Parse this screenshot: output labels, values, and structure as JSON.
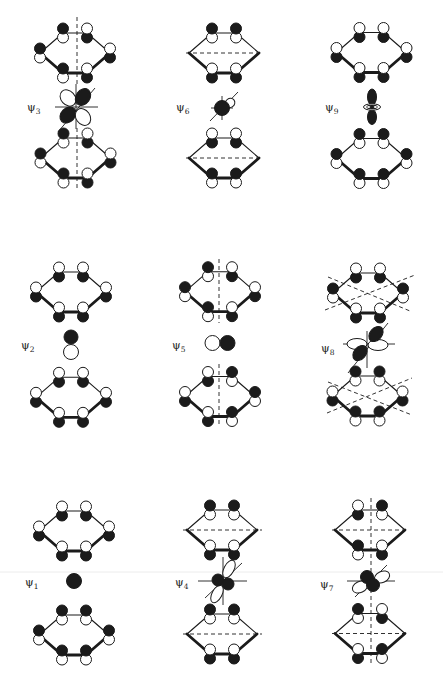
{
  "canvas": {
    "width": 443,
    "height": 679
  },
  "style": {
    "ink": "#1b1b1b",
    "paper": "#ffffff",
    "scan_line_color": "#ececec",
    "lobe_r": 5.5,
    "lobe_offset": 4.5
  },
  "scan_line": {
    "y": 572
  },
  "ring_template": {
    "order": [
      "TL",
      "TR",
      "R",
      "BR",
      "BL",
      "L"
    ],
    "offsets": {
      "TL": [
        -12,
        -20
      ],
      "TR": [
        12,
        -20
      ],
      "R": [
        35,
        0
      ],
      "BR": [
        12,
        20
      ],
      "BL": [
        -12,
        20
      ],
      "L": [
        -35,
        0
      ]
    },
    "front_bonds": [
      "R-BR",
      "BR-BL",
      "BL-L"
    ]
  },
  "panels": [
    {
      "id": "psi3",
      "label": {
        "symbol": "ψ",
        "subscript": "3",
        "x": 27,
        "y": 111
      },
      "rings": [
        {
          "position": "top",
          "cx": 75,
          "cy": 53,
          "upper_lobes": [
            "black",
            "white",
            "white",
            "white",
            "black",
            "black"
          ]
        },
        {
          "position": "bottom",
          "cx": 75.5,
          "cy": 158,
          "upper_lobes": [
            "black",
            "white",
            "white",
            "white",
            "black",
            "black"
          ]
        }
      ],
      "nodal_planes": [
        [
          77,
          17,
          77,
          86
        ],
        [
          77,
          128,
          77,
          190
        ]
      ],
      "orbital": {
        "cx": 76,
        "cy": 107,
        "axes": [
          [
            -21,
            0,
            22,
            0
          ],
          [
            0,
            -23,
            0,
            22
          ],
          [
            -18,
            25,
            19,
            -19
          ]
        ],
        "lobes": [
          {
            "x": -8,
            "y": -9,
            "rx": 9,
            "ry": 7,
            "rot": 48,
            "fill": "white"
          },
          {
            "x": 7,
            "y": -10,
            "rx": 9,
            "ry": 7,
            "rot": -55,
            "fill": "black"
          },
          {
            "x": -8,
            "y": 8,
            "rx": 9,
            "ry": 7,
            "rot": -45,
            "fill": "black"
          },
          {
            "x": 7,
            "y": 10,
            "rx": 9,
            "ry": 7,
            "rot": 55,
            "fill": "white"
          }
        ]
      }
    },
    {
      "id": "psi6",
      "label": {
        "symbol": "ψ",
        "subscript": "6",
        "x": 176,
        "y": 111
      },
      "rings": [
        {
          "position": "top",
          "cx": 224,
          "cy": 53,
          "upper_lobes": [
            "black",
            "black",
            null,
            "white",
            "white",
            null
          ]
        },
        {
          "position": "bottom",
          "cx": 224,
          "cy": 158,
          "upper_lobes": [
            "white",
            "white",
            null,
            "black",
            "black",
            null
          ]
        }
      ],
      "nodal_planes": [
        [
          186,
          53,
          262,
          53
        ],
        [
          186,
          158,
          262,
          158
        ]
      ],
      "orbital": {
        "cx": 222,
        "cy": 108,
        "axes": [
          [
            -12,
            13,
            16,
            -16
          ],
          [
            -11,
            0,
            11,
            0
          ],
          [
            0,
            -12,
            0,
            12
          ]
        ],
        "lobes": [
          {
            "x": 8,
            "y": -5,
            "rx": 5,
            "ry": 4.5,
            "rot": -35,
            "fill": "white"
          },
          {
            "x": 0,
            "y": 0,
            "rx": 7.5,
            "ry": 7.5,
            "rot": 0,
            "fill": "black"
          }
        ]
      }
    },
    {
      "id": "psi9",
      "label": {
        "symbol": "ψ",
        "subscript": "9",
        "x": 325,
        "y": 111
      },
      "rings": [
        {
          "position": "top",
          "cx": 371.5,
          "cy": 52.5,
          "upper_lobes": [
            "white",
            "white",
            "white",
            "white",
            "white",
            "white"
          ]
        },
        {
          "position": "bottom",
          "cx": 371.5,
          "cy": 158.5,
          "upper_lobes": [
            "black",
            "black",
            "black",
            "black",
            "black",
            "black"
          ]
        }
      ],
      "nodal_planes": [],
      "orbital": {
        "cx": 372,
        "cy": 107,
        "axes": [],
        "lobes": [
          {
            "x": 0,
            "y": 10,
            "rx": 4.5,
            "ry": 7.5,
            "rot": 0,
            "fill": "black"
          },
          {
            "x": 0,
            "y": -10,
            "rx": 4.5,
            "ry": 8,
            "rot": 0,
            "fill": "black"
          },
          {
            "x": 0,
            "y": 0,
            "rx": 8.5,
            "ry": 3.2,
            "rot": 0,
            "fill": "white"
          },
          {
            "x": 0,
            "y": 0,
            "rx": 5.5,
            "ry": 1.8,
            "rot": 0,
            "fill": "none"
          },
          {
            "x": 0,
            "y": 0,
            "rx": 2,
            "ry": 1.6,
            "rot": 0,
            "fill": "black"
          }
        ]
      }
    },
    {
      "id": "psi2",
      "label": {
        "symbol": "ψ",
        "subscript": "2",
        "x": 21,
        "y": 349
      },
      "rings": [
        {
          "position": "top",
          "cx": 71,
          "cy": 292,
          "upper_lobes": [
            "white",
            "white",
            "white",
            "white",
            "white",
            "white"
          ]
        },
        {
          "position": "bottom",
          "cx": 71,
          "cy": 397.3,
          "upper_lobes": [
            "white",
            "white",
            "white",
            "white",
            "white",
            "white"
          ]
        }
      ],
      "nodal_planes": [],
      "orbital": {
        "cx": 71,
        "cy": 344,
        "axes": [],
        "lobes": [
          {
            "x": 0,
            "y": -7,
            "rx": 7,
            "ry": 7,
            "rot": 0,
            "fill": "black"
          },
          {
            "x": 0,
            "y": 8,
            "rx": 7.5,
            "ry": 7.5,
            "rot": 0,
            "fill": "white"
          }
        ]
      }
    },
    {
      "id": "psi5",
      "label": {
        "symbol": "ψ",
        "subscript": "5",
        "x": 172,
        "y": 349
      },
      "rings": [
        {
          "position": "top",
          "cx": 220,
          "cy": 291.7,
          "upper_lobes": [
            "black",
            "white",
            "white",
            "white",
            "black",
            "black"
          ]
        },
        {
          "position": "bottom",
          "cx": 220,
          "cy": 396.5,
          "upper_lobes": [
            "white",
            "black",
            "black",
            "black",
            "white",
            "white"
          ]
        }
      ],
      "nodal_planes": [
        [
          219,
          259,
          219,
          323
        ],
        [
          219,
          364,
          219,
          426
        ]
      ],
      "orbital": {
        "cx": 220,
        "cy": 343,
        "axes": [],
        "lobes": [
          {
            "x": -7.5,
            "y": 0,
            "rx": 7.5,
            "ry": 7.5,
            "rot": 0,
            "fill": "white"
          },
          {
            "x": 7.5,
            "y": 0,
            "rx": 7.5,
            "ry": 7.5,
            "rot": 0,
            "fill": "black"
          }
        ]
      }
    },
    {
      "id": "psi8",
      "label": {
        "symbol": "ψ",
        "subscript": "8",
        "x": 321,
        "y": 352
      },
      "rings": [
        {
          "position": "top",
          "cx": 368,
          "cy": 293,
          "upper_lobes": [
            "white",
            "white",
            "black",
            "white",
            "white",
            "black"
          ]
        },
        {
          "position": "bottom",
          "cx": 367.5,
          "cy": 396,
          "upper_lobes": [
            "black",
            "black",
            "white",
            "black",
            "black",
            "white"
          ]
        }
      ],
      "nodal_planes": [
        [
          325,
          310,
          415,
          275
        ],
        [
          328,
          277,
          410,
          311
        ],
        [
          327,
          413,
          412,
          378
        ],
        [
          328,
          382,
          412,
          415
        ]
      ],
      "orbital": {
        "cx": 367,
        "cy": 344,
        "axes": [
          [
            -24,
            0,
            28,
            0
          ],
          [
            0,
            -13,
            0,
            24
          ],
          [
            -19,
            29,
            21,
            -21
          ]
        ],
        "lobes": [
          {
            "x": -10,
            "y": 0,
            "rx": 10,
            "ry": 5.5,
            "rot": 0,
            "fill": "white"
          },
          {
            "x": 11,
            "y": 1,
            "rx": 10,
            "ry": 5.5,
            "rot": 0,
            "fill": "white"
          },
          {
            "x": 9,
            "y": -10,
            "rx": 8.5,
            "ry": 6,
            "rot": -50,
            "fill": "black"
          },
          {
            "x": -7,
            "y": 9,
            "rx": 8.5,
            "ry": 6,
            "rot": -50,
            "fill": "black"
          }
        ]
      }
    },
    {
      "id": "psi1",
      "label": {
        "symbol": "ψ",
        "subscript": "1",
        "x": 25,
        "y": 586
      },
      "rings": [
        {
          "position": "top",
          "cx": 74,
          "cy": 531,
          "upper_lobes": [
            "white",
            "white",
            "white",
            "white",
            "white",
            "white"
          ]
        },
        {
          "position": "bottom",
          "cx": 74,
          "cy": 635,
          "upper_lobes": [
            "black",
            "black",
            "black",
            "black",
            "black",
            "black"
          ]
        }
      ],
      "nodal_planes": [],
      "orbital": {
        "cx": 74,
        "cy": 581,
        "axes": [],
        "lobes": [
          {
            "x": 0,
            "y": 0,
            "rx": 7.5,
            "ry": 7.5,
            "rot": 0,
            "fill": "black"
          }
        ]
      }
    },
    {
      "id": "psi4",
      "label": {
        "symbol": "ψ",
        "subscript": "4",
        "x": 175,
        "y": 586
      },
      "rings": [
        {
          "position": "top",
          "cx": 222,
          "cy": 530,
          "upper_lobes": [
            "black",
            "black",
            null,
            "white",
            "white",
            null
          ]
        },
        {
          "position": "bottom",
          "cx": 222,
          "cy": 634,
          "upper_lobes": [
            "black",
            "black",
            null,
            "white",
            "white",
            null
          ]
        }
      ],
      "nodal_planes": [
        [
          183,
          530,
          262,
          530
        ],
        [
          183,
          634,
          262,
          634
        ]
      ],
      "orbital": {
        "cx": 223,
        "cy": 581,
        "axes": [
          [
            -25,
            0,
            24,
            0
          ],
          [
            0,
            -24,
            0,
            24
          ],
          [
            -18,
            17,
            19,
            -18
          ]
        ],
        "lobes": [
          {
            "x": 6,
            "y": -12,
            "rx": 9.5,
            "ry": 5,
            "rot": -62,
            "fill": "white"
          },
          {
            "x": -6,
            "y": 13,
            "rx": 9.5,
            "ry": 5,
            "rot": -62,
            "fill": "white"
          },
          {
            "x": -5,
            "y": -1,
            "rx": 6,
            "ry": 6,
            "rot": 0,
            "fill": "black"
          },
          {
            "x": 5,
            "y": 3,
            "rx": 6,
            "ry": 6,
            "rot": 0,
            "fill": "black"
          }
        ]
      }
    },
    {
      "id": "psi7",
      "label": {
        "symbol": "ψ",
        "subscript": "7",
        "x": 320,
        "y": 588
      },
      "rings": [
        {
          "position": "top",
          "cx": 370,
          "cy": 530,
          "upper_lobes": [
            "white",
            "black",
            null,
            "white",
            "black",
            null
          ]
        },
        {
          "position": "bottom",
          "cx": 370,
          "cy": 633.5,
          "upper_lobes": [
            "black",
            "white",
            null,
            "black",
            "white",
            null
          ]
        }
      ],
      "nodal_planes": [
        [
          332,
          530,
          409,
          530
        ],
        [
          332,
          633.5,
          409,
          633.5
        ],
        [
          371,
          498,
          371,
          665
        ]
      ],
      "orbital": {
        "cx": 370,
        "cy": 581,
        "axes": [
          [
            -23,
            0,
            25,
            0
          ],
          [
            -15,
            16,
            17,
            -16
          ]
        ],
        "lobes": [
          {
            "x": 12,
            "y": -4,
            "rx": 8,
            "ry": 5.5,
            "rot": -25,
            "fill": "white"
          },
          {
            "x": -10,
            "y": 6,
            "rx": 8,
            "ry": 5.5,
            "rot": -25,
            "fill": "white"
          },
          {
            "x": -3,
            "y": -4,
            "rx": 6.5,
            "ry": 6.5,
            "rot": 0,
            "fill": "black"
          },
          {
            "x": 3,
            "y": 4,
            "rx": 6.5,
            "ry": 6.5,
            "rot": 0,
            "fill": "black"
          }
        ]
      }
    }
  ]
}
